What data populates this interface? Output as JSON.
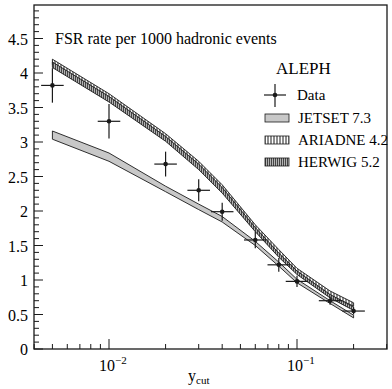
{
  "chart_data": {
    "type": "line",
    "title": "FSR rate per 1000 hadronic events",
    "xlabel": "y_cut",
    "xlabel_main": "y",
    "xlabel_sub": "cut",
    "ylabel": "",
    "xscale": "log",
    "xlim": [
      0.004,
      0.3
    ],
    "ylim": [
      0,
      4.9
    ],
    "grid": false,
    "legend_position": "upper right",
    "legend_header": "ALEPH",
    "y_ticks": [
      {
        "value": 0,
        "label": "0"
      },
      {
        "value": 0.5,
        "label": "0.5"
      },
      {
        "value": 1,
        "label": "1"
      },
      {
        "value": 1.5,
        "label": "1.5"
      },
      {
        "value": 2,
        "label": "2"
      },
      {
        "value": 2.5,
        "label": "2.5"
      },
      {
        "value": 3,
        "label": "3"
      },
      {
        "value": 3.5,
        "label": "3.5"
      },
      {
        "value": 4,
        "label": "4"
      },
      {
        "value": 4.5,
        "label": "4.5"
      }
    ],
    "x_ticks": [
      {
        "value": 0.01,
        "base": "10",
        "exp": "−2"
      },
      {
        "value": 0.1,
        "base": "10",
        "exp": "−1"
      }
    ],
    "series": [
      {
        "name": "Data",
        "kind": "points",
        "x": [
          0.005,
          0.01,
          0.02,
          0.03,
          0.04,
          0.06,
          0.08,
          0.1,
          0.15,
          0.2
        ],
        "y": [
          3.82,
          3.3,
          2.68,
          2.3,
          1.99,
          1.58,
          1.22,
          0.98,
          0.7,
          0.55
        ],
        "yerr": [
          0.25,
          0.25,
          0.18,
          0.16,
          0.13,
          0.12,
          0.1,
          0.08,
          0.06,
          0.05
        ],
        "xerr_log": 0.12
      },
      {
        "name": "JETSET 7.3",
        "kind": "band",
        "fill": "#c8c8c8",
        "x": [
          0.005,
          0.01,
          0.02,
          0.03,
          0.04,
          0.06,
          0.08,
          0.1,
          0.15,
          0.2
        ],
        "y_low": [
          3.04,
          2.72,
          2.28,
          2.02,
          1.84,
          1.5,
          1.2,
          0.96,
          0.66,
          0.45
        ],
        "y_high": [
          3.16,
          2.84,
          2.36,
          2.1,
          1.92,
          1.56,
          1.26,
          1.01,
          0.7,
          0.49
        ]
      },
      {
        "name": "ARIADNE 4.2",
        "kind": "band",
        "fill": "hatch-vertical",
        "x": [
          0.005,
          0.01,
          0.02,
          0.03,
          0.04,
          0.06,
          0.08,
          0.1,
          0.15,
          0.2
        ],
        "y_low": [
          4.12,
          3.62,
          3.05,
          2.64,
          2.3,
          1.74,
          1.38,
          1.12,
          0.78,
          0.62
        ],
        "y_high": [
          4.2,
          3.7,
          3.12,
          2.72,
          2.38,
          1.8,
          1.44,
          1.17,
          0.84,
          0.67
        ]
      },
      {
        "name": "HERWIG 5.2",
        "kind": "band",
        "fill": "hatch-dense",
        "x": [
          0.005,
          0.01,
          0.02,
          0.03,
          0.04,
          0.06,
          0.08,
          0.1,
          0.15,
          0.2
        ],
        "y_low": [
          4.08,
          3.58,
          3.01,
          2.6,
          2.26,
          1.7,
          1.33,
          1.08,
          0.74,
          0.56
        ],
        "y_high": [
          4.16,
          3.66,
          3.08,
          2.68,
          2.34,
          1.76,
          1.39,
          1.13,
          0.79,
          0.61
        ]
      }
    ]
  },
  "colors": {
    "axis": "#1a1a1a",
    "jetset_fill": "#c8c8c8",
    "band_edge": "#1a1a1a"
  }
}
